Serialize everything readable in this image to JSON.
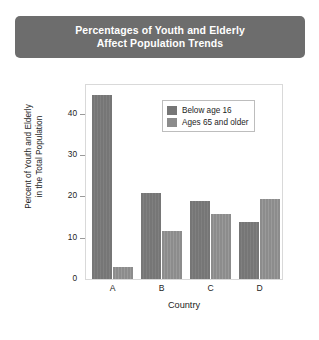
{
  "banner": {
    "line1": "Percentages of Youth and Elderly",
    "line2": "Affect Population Trends",
    "background_color": "#6d6d6d",
    "text_color": "#ffffff"
  },
  "chart_data": {
    "type": "bar",
    "title": "Percentages of Youth and Elderly Affect Population Trends",
    "categories": [
      "A",
      "B",
      "C",
      "D"
    ],
    "series": [
      {
        "name": "Below age 16",
        "color": "#767676",
        "values": [
          44.5,
          20.8,
          19.0,
          13.7
        ]
      },
      {
        "name": "Ages 65 and older",
        "color": "#8c8c8c",
        "values": [
          2.8,
          11.6,
          15.8,
          19.5
        ]
      }
    ],
    "xlabel": "Country",
    "ylabel": "Percent of Youth and Elderly in the Total Population",
    "ylabel_line1": "Percent of Youth and Elderly",
    "ylabel_line2": "in the Total Population",
    "ylim": [
      0,
      47
    ],
    "yticks": [
      0,
      10,
      20,
      30,
      40
    ],
    "ytick_labels": [
      "0",
      "10",
      "20",
      "30",
      "40"
    ],
    "grid": false,
    "legend_position": "top-right"
  }
}
